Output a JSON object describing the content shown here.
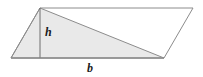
{
  "figure": {
    "type": "geometry-diagram",
    "background_color": "#ffffff",
    "canvas": {
      "width": 203,
      "height": 77
    },
    "labels": {
      "height_label": "h",
      "base_label": "b"
    },
    "style": {
      "stroke_color": "#8c8c8c",
      "stroke_color_dark": "#6f6f6f",
      "fill_color": "#e9e9e9",
      "label_color": "#1b1b1b",
      "stroke_width": 1
    },
    "geometry": {
      "parallelogram": {
        "name": "parallelogram-outline",
        "points": "11,58 40,8 193,8 164,58",
        "vertices": [
          {
            "name": "bottom-left",
            "x": 11,
            "y": 58
          },
          {
            "name": "top-left",
            "x": 40,
            "y": 8
          },
          {
            "name": "top-right",
            "x": 193,
            "y": 8
          },
          {
            "name": "bottom-right",
            "x": 164,
            "y": 58
          }
        ]
      },
      "triangle": {
        "name": "shaded-triangle",
        "points": "11,58 40,8 164,58",
        "vertices": [
          {
            "name": "triangle-left",
            "x": 11,
            "y": 58
          },
          {
            "name": "triangle-apex",
            "x": 40,
            "y": 8
          },
          {
            "name": "triangle-right",
            "x": 164,
            "y": 58
          }
        ]
      },
      "height_segment": {
        "name": "height-line",
        "x1": 40,
        "y1": 8,
        "x2": 40,
        "y2": 58
      },
      "base_segment": {
        "name": "base-line",
        "x1": 11,
        "y1": 58,
        "x2": 164,
        "y2": 58
      }
    }
  }
}
